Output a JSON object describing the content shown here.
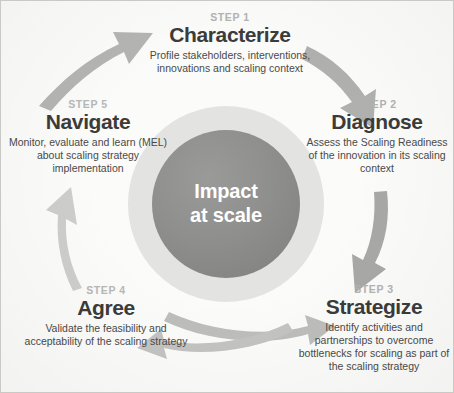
{
  "diagram": {
    "center": {
      "line1": "Impact",
      "line2": "at scale"
    },
    "colors": {
      "background": "#fbfbfa",
      "border": "#c9c9c6",
      "hub_core": "#8f8f8d",
      "hub_halo": "#e3e3e1",
      "arrow": "#b5b5b3",
      "step_title": "#3b3b39",
      "step_kicker": "#b2b2b0",
      "step_desc": "#4a4a48",
      "center_text": "#ffffff"
    },
    "steps": [
      {
        "id": "step-1",
        "kicker": "STEP 1",
        "title": "Characterize",
        "description": "Profile stakeholders, interventions, innovations and scaling context"
      },
      {
        "id": "step-2",
        "kicker": "STEP 2",
        "title": "Diagnose",
        "description": "Assess the Scaling Readiness of the innovation in its scaling context"
      },
      {
        "id": "step-3",
        "kicker": "STEP 3",
        "title": "Strategize",
        "description": "Identify activities and partnerships to overcome bottlenecks for scaling as part of the scaling strategy"
      },
      {
        "id": "step-4",
        "kicker": "STEP 4",
        "title": "Agree",
        "description": "Validate the feasibility and acceptability of the scaling strategy"
      },
      {
        "id": "step-5",
        "kicker": "STEP 5",
        "title": "Navigate",
        "description": "Monitor, evaluate and learn (MEL) about scaling strategy implementation"
      }
    ],
    "arrows": [
      {
        "id": "arrow-navigate-to-characterize",
        "from": "Navigate",
        "to": "Characterize",
        "direction": "up-right"
      },
      {
        "id": "arrow-characterize-to-diagnose",
        "from": "Characterize",
        "to": "Diagnose",
        "direction": "down-right"
      },
      {
        "id": "arrow-diagnose-to-strategize",
        "from": "Diagnose",
        "to": "Strategize",
        "direction": "down"
      },
      {
        "id": "arrow-agree-to-strategize",
        "from": "Agree",
        "to": "Strategize",
        "direction": "right"
      },
      {
        "id": "arrow-strategize-to-agree",
        "from": "Strategize",
        "to": "Agree",
        "direction": "left"
      },
      {
        "id": "arrow-agree-to-navigate",
        "from": "Agree",
        "to": "Navigate",
        "direction": "up"
      }
    ]
  }
}
